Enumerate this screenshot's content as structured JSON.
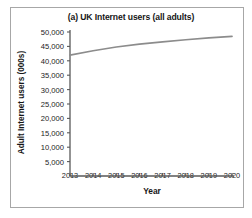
{
  "figure": {
    "border_color": "#a7a7a7",
    "background": "#ffffff"
  },
  "chart_data": {
    "type": "line",
    "title": "(a) UK Internet users (all adults)",
    "xlabel": "Year",
    "ylabel": "Adult Internet users (000s)",
    "x": [
      2013,
      2014,
      2015,
      2016,
      2017,
      2018,
      2019,
      2020
    ],
    "xtick_labels": [
      "2013",
      "2014",
      "2015",
      "2016",
      "2017",
      "2018",
      "2019",
      "2020"
    ],
    "values": [
      42000,
      43500,
      44800,
      45800,
      46600,
      47300,
      47950,
      48500
    ],
    "series": [
      {
        "name": "UK adult internet users",
        "values": [
          42000,
          43500,
          44800,
          45800,
          46600,
          47300,
          47950,
          48500
        ],
        "color": "#8c8c8c"
      }
    ],
    "ylim": [
      0,
      50000
    ],
    "xlim": [
      2013,
      2020
    ],
    "ytick_values": [
      5000,
      10000,
      15000,
      20000,
      25000,
      30000,
      35000,
      40000,
      45000,
      50000
    ],
    "ytick_labels": [
      "5,000",
      "10,000",
      "15,000",
      "20,000",
      "25,000",
      "30,000",
      "35,000",
      "40,000",
      "45,000",
      "50,000"
    ],
    "grid": false,
    "legend": false,
    "line_color": "#8c8c8c",
    "axis_color": "#595959",
    "markers": false
  }
}
